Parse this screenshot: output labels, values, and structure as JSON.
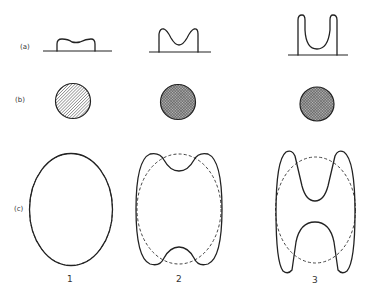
{
  "figure": {
    "row_labels": {
      "a": "(a)",
      "b": "(b)",
      "c": "(c)"
    },
    "column_labels": [
      "1",
      "2",
      "3"
    ],
    "rows": {
      "a": {
        "description": "Side-view profiles of a deforming body on a baseline",
        "items": [
          {
            "column": "1",
            "shape": "low flat bump with slight raised rims"
          },
          {
            "column": "2",
            "shape": "M-shaped profile with two peaks and central dip"
          },
          {
            "column": "3",
            "shape": "deep U-shaped profile with tall narrow walls"
          }
        ]
      },
      "b": {
        "description": "Top-view hatched disks",
        "items": [
          {
            "column": "1",
            "hatch": "diagonal single hatch (lighter)"
          },
          {
            "column": "2",
            "hatch": "cross hatch (darker)"
          },
          {
            "column": "3",
            "hatch": "cross hatch (darker)"
          }
        ]
      },
      "c": {
        "description": "Cross-section outlines (solid) compared with reference ellipse (dashed)",
        "items": [
          {
            "column": "1",
            "shape": "ellipse coinciding with dashed reference"
          },
          {
            "column": "2",
            "shape": "outline with shallow notches at top and bottom"
          },
          {
            "column": "3",
            "shape": "H-shaped outline with deep notches at top and bottom"
          }
        ]
      }
    },
    "colors": {
      "ink": "#222222",
      "background": "#ffffff"
    }
  }
}
